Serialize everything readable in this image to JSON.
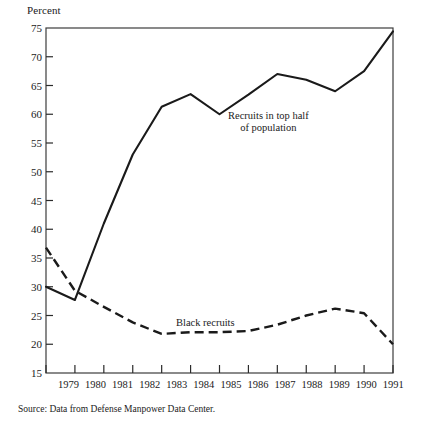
{
  "figure": {
    "y_axis_unit_label": "Percent",
    "source_note": "Source: Data from Defense Manpower Data Center."
  },
  "annotations": {
    "solid_series_label_line1": "Recruits in top half",
    "solid_series_label_line2": "of population",
    "dashed_series_label": "Black recruits"
  },
  "chart_data": {
    "type": "line",
    "title": "",
    "xlabel": "",
    "ylabel": "Percent",
    "ylim": [
      15,
      75
    ],
    "yticks": [
      15,
      20,
      25,
      30,
      35,
      40,
      45,
      50,
      55,
      60,
      65,
      70,
      75
    ],
    "ytick_labels": [
      "15",
      "20",
      "25",
      "30",
      "35",
      "40",
      "45",
      "50",
      "55",
      "60",
      "65",
      "70",
      "75"
    ],
    "grid": false,
    "legend_position": "inline-annotation",
    "categories": [
      "1979",
      "1980",
      "1981",
      "1982",
      "1983",
      "1984",
      "1985",
      "1986",
      "1987",
      "1988",
      "1989",
      "1990",
      "1991"
    ],
    "x": [
      1979,
      1980,
      1981,
      1982,
      1983,
      1984,
      1985,
      1986,
      1987,
      1988,
      1989,
      1990,
      1991
    ],
    "series": [
      {
        "name": "Recruits in top half of population",
        "style": "solid",
        "color": "#1a1a1a",
        "values": [
          30.0,
          27.7,
          41.0,
          53.0,
          61.3,
          63.5,
          60.0,
          63.4,
          67.0,
          66.0,
          64.0,
          67.5,
          74.4
        ]
      },
      {
        "name": "Black recruits",
        "style": "dashed",
        "color": "#1a1a1a",
        "values": [
          36.8,
          29.3,
          26.5,
          23.8,
          21.8,
          22.1,
          22.1,
          22.3,
          23.4,
          25.0,
          26.2,
          25.4,
          20.0
        ]
      }
    ]
  },
  "axes_geometry": {
    "plot_left": 46,
    "plot_right": 393,
    "plot_top": 28,
    "plot_bottom": 373
  }
}
